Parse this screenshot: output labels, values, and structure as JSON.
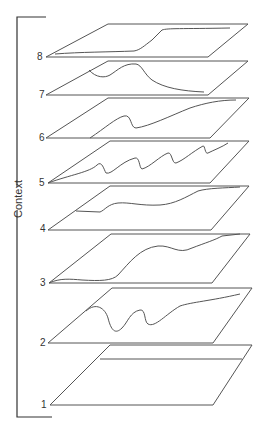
{
  "diagram": {
    "axis_label": "Context",
    "stroke_color": "#555555",
    "background": "#ffffff",
    "layers": [
      {
        "label": "1",
        "content": "straight horizontal line near far edge"
      },
      {
        "label": "2",
        "content": "wavy curve with two loops rising to right"
      },
      {
        "label": "3",
        "content": "gently rising undulating curve"
      },
      {
        "label": "4",
        "content": "step-like rising curve"
      },
      {
        "label": "5",
        "content": "sawtooth zigzag curve"
      },
      {
        "label": "6",
        "content": "S-shaped rising curve"
      },
      {
        "label": "7",
        "content": "single hump curve falling to right"
      },
      {
        "label": "8",
        "content": "flattened curve along edges"
      }
    ]
  }
}
